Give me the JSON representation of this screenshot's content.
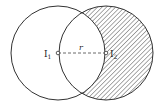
{
  "diagram": {
    "type": "two-circle-overlap",
    "circle1": {
      "center_label": "I",
      "center_subscript": "1",
      "cx": 58,
      "cy": 53,
      "r": 47
    },
    "circle2": {
      "center_label": "I",
      "center_subscript": "2",
      "cx": 106,
      "cy": 53,
      "r": 47
    },
    "distance_label": "r",
    "shaded_region": "circle 2 minus circle 1",
    "colors": {
      "stroke": "#333333",
      "hatch": "#555555",
      "background": "#ffffff"
    }
  }
}
